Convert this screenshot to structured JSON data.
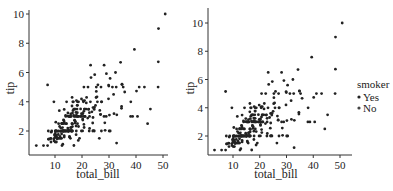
{
  "figure": {
    "background": "#ffffff",
    "point_color": "#222222",
    "axis_color": "#333333"
  },
  "chart_data": [
    {
      "type": "scatter",
      "title": "",
      "xlabel": "total_bill",
      "ylabel": "tip",
      "xticks": [
        10,
        20,
        30,
        40,
        50
      ],
      "yticks": [
        2,
        4,
        6,
        8,
        10
      ],
      "xlim": [
        0.5,
        52.5
      ],
      "ylim": [
        0.5,
        10.5
      ],
      "grid": false,
      "legend": null,
      "x": [
        16.99,
        10.34,
        21.01,
        23.68,
        24.59,
        25.29,
        8.77,
        26.88,
        15.04,
        14.78,
        10.27,
        35.26,
        15.42,
        18.43,
        14.83,
        21.58,
        10.33,
        16.29,
        16.97,
        20.65,
        17.92,
        20.29,
        15.77,
        39.42,
        19.82,
        17.81,
        13.37,
        12.69,
        21.7,
        19.65,
        9.55,
        18.35,
        15.06,
        20.69,
        17.78,
        24.06,
        16.31,
        16.93,
        18.69,
        31.27,
        16.04,
        17.46,
        13.94,
        9.68,
        30.4,
        18.29,
        22.23,
        32.4,
        28.55,
        18.04,
        12.54,
        10.29,
        34.81,
        9.94,
        25.56,
        19.49,
        38.01,
        26.41,
        11.24,
        48.27,
        20.29,
        13.81,
        11.02,
        18.29,
        17.59,
        20.08,
        16.45,
        3.07,
        20.23,
        15.01,
        12.02,
        17.07,
        26.86,
        25.28,
        14.73,
        10.51,
        17.92,
        27.2,
        22.76,
        17.29,
        19.44,
        16.66,
        10.07,
        32.68,
        15.98,
        34.83,
        13.03,
        18.28,
        24.71,
        21.16,
        28.97,
        22.49,
        5.75,
        16.32,
        22.75,
        40.17,
        27.28,
        12.03,
        21.01,
        12.46,
        11.35,
        15.38,
        44.3,
        22.42,
        20.92,
        15.36,
        20.49,
        25.21,
        18.24,
        14.31,
        14.0,
        7.25,
        38.07,
        23.95,
        25.71,
        17.31,
        29.93,
        10.65,
        12.43,
        24.08,
        11.69,
        13.42,
        14.26,
        15.95,
        12.48,
        29.8,
        8.52,
        14.52,
        11.38,
        22.82,
        19.08,
        20.27,
        11.17,
        12.26,
        18.26,
        8.51,
        10.33,
        14.15,
        16.0,
        13.16,
        17.47,
        34.3,
        41.19,
        27.05,
        16.43,
        8.35,
        18.64,
        11.87,
        9.78,
        7.51,
        14.07,
        13.13,
        17.26,
        24.55,
        19.77,
        29.85,
        48.17,
        25.0,
        13.39,
        16.49,
        21.5,
        12.66,
        16.21,
        13.81,
        17.51,
        24.52,
        20.76,
        31.71,
        10.59,
        10.63,
        50.81,
        15.81,
        7.25,
        31.85,
        16.82,
        32.9,
        17.89,
        14.48,
        9.6,
        34.63,
        34.65,
        23.33,
        45.35,
        23.17,
        40.55,
        20.69,
        20.9,
        30.46,
        18.15,
        23.1,
        15.69,
        19.81,
        28.44,
        15.48,
        16.58,
        7.56,
        10.34,
        43.11,
        13.0,
        13.51,
        18.71,
        12.74,
        13.0,
        16.4,
        20.53,
        16.47,
        26.59,
        38.73,
        24.27,
        12.76,
        30.06,
        25.89,
        48.33,
        13.27,
        28.17,
        12.9,
        28.15,
        11.59,
        7.74,
        30.14,
        12.16,
        13.42,
        8.58,
        15.98,
        13.42,
        16.27,
        10.09,
        20.45,
        13.28,
        22.12,
        24.01,
        15.69,
        11.61,
        10.77,
        15.53,
        10.07,
        12.6,
        32.83,
        35.83,
        29.03,
        27.18,
        22.67,
        17.82,
        18.78
      ],
      "y": [
        1.01,
        1.66,
        3.5,
        3.31,
        3.61,
        4.71,
        2.0,
        3.12,
        1.96,
        3.23,
        1.71,
        5.0,
        1.57,
        3.0,
        3.02,
        3.92,
        1.67,
        3.71,
        3.5,
        3.35,
        4.08,
        2.75,
        2.23,
        7.58,
        3.18,
        2.34,
        2.0,
        2.0,
        4.3,
        3.0,
        1.45,
        2.5,
        3.0,
        2.45,
        3.27,
        3.6,
        2.0,
        3.07,
        2.31,
        5.0,
        2.24,
        2.54,
        3.06,
        1.32,
        5.6,
        3.0,
        5.0,
        6.0,
        2.05,
        3.0,
        2.5,
        2.6,
        5.2,
        1.56,
        4.34,
        3.51,
        3.0,
        1.5,
        1.76,
        6.73,
        3.21,
        2.0,
        1.98,
        3.76,
        2.64,
        3.15,
        2.47,
        1.0,
        2.01,
        2.09,
        1.97,
        3.0,
        3.14,
        5.0,
        2.2,
        1.25,
        3.08,
        4.0,
        3.0,
        2.71,
        3.0,
        3.4,
        1.83,
        5.0,
        2.03,
        5.17,
        2.0,
        4.0,
        5.85,
        3.0,
        3.0,
        3.5,
        1.0,
        4.3,
        3.25,
        4.73,
        4.0,
        1.5,
        3.0,
        1.5,
        2.5,
        3.0,
        2.5,
        3.48,
        4.08,
        1.64,
        4.06,
        4.29,
        3.76,
        4.0,
        3.0,
        1.0,
        4.0,
        2.55,
        4.0,
        3.5,
        5.07,
        1.5,
        1.8,
        2.92,
        2.31,
        1.68,
        2.5,
        2.0,
        2.52,
        4.2,
        1.48,
        2.0,
        2.0,
        2.18,
        1.5,
        2.83,
        1.5,
        2.0,
        3.25,
        1.25,
        2.0,
        2.0,
        2.0,
        2.75,
        3.5,
        6.7,
        5.0,
        5.0,
        2.3,
        1.5,
        1.36,
        1.63,
        1.73,
        2.0,
        2.5,
        2.0,
        2.74,
        2.0,
        2.0,
        5.14,
        5.0,
        3.75,
        2.61,
        2.0,
        3.5,
        2.5,
        2.0,
        2.0,
        3.0,
        3.48,
        2.24,
        4.5,
        1.61,
        2.0,
        10.0,
        3.16,
        5.15,
        3.18,
        4.0,
        3.11,
        2.0,
        2.0,
        4.0,
        3.55,
        3.68,
        5.65,
        3.5,
        6.5,
        3.0,
        5.0,
        3.5,
        2.0,
        3.5,
        4.0,
        1.5,
        4.19,
        2.56,
        2.02,
        4.0,
        1.44,
        2.0,
        5.0,
        2.0,
        2.0,
        4.0,
        2.01,
        2.0,
        2.5,
        4.0,
        3.23,
        3.41,
        3.0,
        2.03,
        2.23,
        2.0,
        5.16,
        9.0,
        2.5,
        6.5,
        1.1,
        3.0,
        1.5,
        1.44,
        3.09,
        2.2,
        3.48,
        1.92,
        3.0,
        1.58,
        2.5,
        2.0,
        3.0,
        2.72,
        2.88,
        2.0,
        3.0,
        3.39,
        1.47,
        3.0,
        1.25,
        1.0,
        1.17,
        4.67,
        5.92,
        2.0,
        2.0,
        1.75,
        3.0
      ]
    },
    {
      "type": "scatter",
      "title": "",
      "xlabel": "total_bill",
      "ylabel": "tip",
      "xticks": [
        10,
        20,
        30,
        40,
        50
      ],
      "yticks": [
        2,
        4,
        6,
        8,
        10
      ],
      "xlim": [
        0.5,
        55.5
      ],
      "ylim": [
        0.6,
        11.0
      ],
      "grid": false,
      "hue": "smoker",
      "legend": {
        "title": "smoker",
        "position": "right",
        "entries": [
          {
            "label": "Yes",
            "color": "#222222"
          },
          {
            "label": "No",
            "color": "#222222"
          }
        ]
      },
      "same_points_as": 0
    }
  ]
}
